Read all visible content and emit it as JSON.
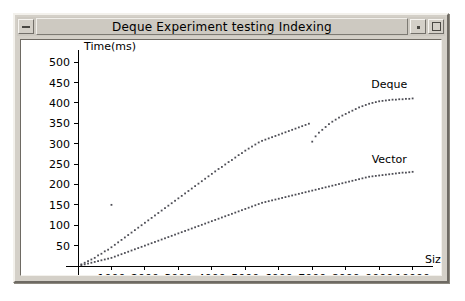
{
  "window": {
    "title": "Deque Experiment testing Indexing",
    "controls": {
      "minimize_label": "—",
      "restore_label": "·",
      "maximize_label": "□"
    }
  },
  "chart_data": {
    "type": "scatter",
    "title": "",
    "xlabel": "Size",
    "ylabel": "Time(ms)",
    "xlim": [
      0,
      10400
    ],
    "ylim": [
      0,
      520
    ],
    "grid": false,
    "legend_position": "inline-right",
    "x_ticks": [
      1000,
      2000,
      3000,
      4000,
      5000,
      6000,
      7000,
      8000,
      9000,
      10000
    ],
    "y_ticks": [
      50,
      100,
      150,
      200,
      250,
      300,
      350,
      400,
      450,
      500
    ],
    "series": [
      {
        "name": "Deque",
        "color": "#4d4d55",
        "label_x": 9300,
        "label_y": 437,
        "points": [
          [
            100,
            4
          ],
          [
            200,
            8
          ],
          [
            300,
            12
          ],
          [
            400,
            16
          ],
          [
            500,
            20
          ],
          [
            600,
            26
          ],
          [
            700,
            30
          ],
          [
            800,
            36
          ],
          [
            900,
            40
          ],
          [
            1000,
            46
          ],
          [
            1000,
            150
          ],
          [
            1100,
            52
          ],
          [
            1200,
            58
          ],
          [
            1300,
            64
          ],
          [
            1400,
            70
          ],
          [
            1500,
            76
          ],
          [
            1600,
            82
          ],
          [
            1700,
            88
          ],
          [
            1800,
            94
          ],
          [
            1900,
            100
          ],
          [
            2000,
            106
          ],
          [
            2100,
            112
          ],
          [
            2200,
            118
          ],
          [
            2300,
            124
          ],
          [
            2400,
            130
          ],
          [
            2500,
            136
          ],
          [
            2600,
            142
          ],
          [
            2700,
            148
          ],
          [
            2800,
            154
          ],
          [
            2900,
            160
          ],
          [
            3000,
            166
          ],
          [
            3100,
            172
          ],
          [
            3200,
            178
          ],
          [
            3300,
            184
          ],
          [
            3400,
            190
          ],
          [
            3500,
            196
          ],
          [
            3600,
            202
          ],
          [
            3700,
            208
          ],
          [
            3800,
            214
          ],
          [
            3900,
            220
          ],
          [
            4000,
            226
          ],
          [
            4100,
            232
          ],
          [
            4200,
            238
          ],
          [
            4300,
            243
          ],
          [
            4400,
            249
          ],
          [
            4500,
            255
          ],
          [
            4600,
            260
          ],
          [
            4700,
            266
          ],
          [
            4800,
            272
          ],
          [
            4900,
            277
          ],
          [
            5000,
            283
          ],
          [
            5100,
            288
          ],
          [
            5200,
            293
          ],
          [
            5300,
            298
          ],
          [
            5400,
            303
          ],
          [
            5500,
            307
          ],
          [
            5600,
            310
          ],
          [
            5700,
            313
          ],
          [
            5800,
            316
          ],
          [
            5900,
            319
          ],
          [
            6000,
            322
          ],
          [
            6100,
            325
          ],
          [
            6200,
            328
          ],
          [
            6300,
            331
          ],
          [
            6400,
            334
          ],
          [
            6500,
            337
          ],
          [
            6600,
            340
          ],
          [
            6700,
            343
          ],
          [
            6800,
            346
          ],
          [
            6900,
            349
          ],
          [
            7000,
            305
          ],
          [
            7100,
            318
          ],
          [
            7200,
            327
          ],
          [
            7300,
            334
          ],
          [
            7400,
            341
          ],
          [
            7500,
            348
          ],
          [
            7600,
            354
          ],
          [
            7700,
            359
          ],
          [
            7800,
            364
          ],
          [
            7900,
            369
          ],
          [
            8000,
            373
          ],
          [
            8100,
            377
          ],
          [
            8200,
            381
          ],
          [
            8300,
            385
          ],
          [
            8400,
            389
          ],
          [
            8500,
            392
          ],
          [
            8600,
            395
          ],
          [
            8700,
            398
          ],
          [
            8800,
            400
          ],
          [
            8900,
            402
          ],
          [
            9000,
            404
          ],
          [
            9100,
            405
          ],
          [
            9200,
            406
          ],
          [
            9300,
            407
          ],
          [
            9400,
            408
          ],
          [
            9500,
            408
          ],
          [
            9600,
            409
          ],
          [
            9700,
            409
          ],
          [
            9800,
            410
          ],
          [
            9900,
            410
          ],
          [
            10000,
            411
          ]
        ]
      },
      {
        "name": "Vector",
        "color": "#4d4d55",
        "label_x": 9300,
        "label_y": 253,
        "points": [
          [
            100,
            2
          ],
          [
            200,
            4
          ],
          [
            300,
            6
          ],
          [
            400,
            8
          ],
          [
            500,
            10
          ],
          [
            600,
            12
          ],
          [
            700,
            14
          ],
          [
            800,
            16
          ],
          [
            900,
            18
          ],
          [
            1000,
            20
          ],
          [
            1100,
            23
          ],
          [
            1200,
            26
          ],
          [
            1300,
            29
          ],
          [
            1400,
            32
          ],
          [
            1500,
            35
          ],
          [
            1600,
            38
          ],
          [
            1700,
            41
          ],
          [
            1800,
            44
          ],
          [
            1900,
            47
          ],
          [
            2000,
            50
          ],
          [
            2100,
            53
          ],
          [
            2200,
            56
          ],
          [
            2300,
            59
          ],
          [
            2400,
            62
          ],
          [
            2500,
            65
          ],
          [
            2600,
            68
          ],
          [
            2700,
            71
          ],
          [
            2800,
            74
          ],
          [
            2900,
            77
          ],
          [
            3000,
            80
          ],
          [
            3100,
            83
          ],
          [
            3200,
            86
          ],
          [
            3300,
            89
          ],
          [
            3400,
            92
          ],
          [
            3500,
            95
          ],
          [
            3600,
            98
          ],
          [
            3700,
            101
          ],
          [
            3800,
            104
          ],
          [
            3900,
            107
          ],
          [
            4000,
            110
          ],
          [
            4100,
            113
          ],
          [
            4200,
            116
          ],
          [
            4300,
            119
          ],
          [
            4400,
            122
          ],
          [
            4500,
            125
          ],
          [
            4600,
            128
          ],
          [
            4700,
            131
          ],
          [
            4800,
            134
          ],
          [
            4900,
            137
          ],
          [
            5000,
            140
          ],
          [
            5100,
            143
          ],
          [
            5200,
            146
          ],
          [
            5300,
            149
          ],
          [
            5400,
            152
          ],
          [
            5500,
            155
          ],
          [
            5600,
            157
          ],
          [
            5700,
            159
          ],
          [
            5800,
            161
          ],
          [
            5900,
            163
          ],
          [
            6000,
            165
          ],
          [
            6100,
            167
          ],
          [
            6200,
            169
          ],
          [
            6300,
            171
          ],
          [
            6400,
            173
          ],
          [
            6500,
            175
          ],
          [
            6600,
            177
          ],
          [
            6700,
            179
          ],
          [
            6800,
            181
          ],
          [
            6900,
            183
          ],
          [
            7000,
            185
          ],
          [
            7100,
            187
          ],
          [
            7200,
            189
          ],
          [
            7300,
            191
          ],
          [
            7400,
            193
          ],
          [
            7500,
            195
          ],
          [
            7600,
            197
          ],
          [
            7700,
            199
          ],
          [
            7800,
            201
          ],
          [
            7900,
            203
          ],
          [
            8000,
            205
          ],
          [
            8100,
            207
          ],
          [
            8200,
            209
          ],
          [
            8300,
            211
          ],
          [
            8400,
            213
          ],
          [
            8500,
            215
          ],
          [
            8600,
            217
          ],
          [
            8700,
            219
          ],
          [
            8800,
            220
          ],
          [
            8900,
            221
          ],
          [
            9000,
            222
          ],
          [
            9100,
            223
          ],
          [
            9200,
            224
          ],
          [
            9300,
            225
          ],
          [
            9400,
            226
          ],
          [
            9500,
            227
          ],
          [
            9600,
            228
          ],
          [
            9700,
            229
          ],
          [
            9800,
            229
          ],
          [
            9900,
            230
          ],
          [
            10000,
            231
          ]
        ]
      }
    ]
  }
}
